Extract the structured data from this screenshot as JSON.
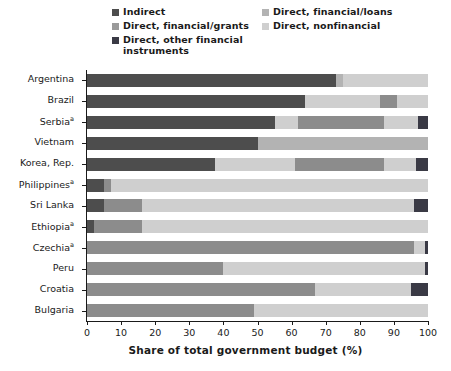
{
  "chart_data": {
    "type": "bar",
    "orientation": "horizontal",
    "stacked": true,
    "stack_mode": "percent",
    "title": "",
    "xlabel": "Share of total government budget (%)",
    "ylabel": "",
    "xlim": [
      0,
      100
    ],
    "xticks": [
      0,
      10,
      20,
      30,
      40,
      50,
      60,
      70,
      80,
      90,
      100
    ],
    "grid": false,
    "legend_position": "top",
    "categories": [
      "Argentina",
      "Brazil",
      "Serbiaᵃ",
      "Vietnam",
      "Korea, Rep.",
      "Philippinesᵃ",
      "Sri Lanka",
      "Ethiopiaᵃ",
      "Czechiaᵃ",
      "Peru",
      "Croatia",
      "Bulgaria"
    ],
    "series": [
      {
        "name": "Indirect",
        "color": "#4d4d4d",
        "values": [
          73,
          64,
          55,
          50,
          37.5,
          5,
          5,
          2,
          0,
          0,
          0,
          0
        ]
      },
      {
        "name": "Direct, financial/loans",
        "color": "#b3b3b3",
        "values": [
          2,
          22,
          7,
          50,
          23,
          2,
          0,
          0,
          0,
          0,
          0,
          0
        ]
      },
      {
        "name": "Direct, financial/grants",
        "color": "#8c8c8c",
        "values": [
          0,
          5,
          25,
          0,
          26,
          0,
          11,
          14,
          96,
          40,
          67,
          49
        ]
      },
      {
        "name": "Direct, nonfinancial",
        "color": "#cfcfcf",
        "values": [
          25,
          9,
          10,
          0,
          10,
          93,
          80,
          84,
          3,
          59,
          28,
          51
        ]
      },
      {
        "name": "Direct, other financial instruments",
        "color": "#3a3a45",
        "values": [
          0,
          0,
          3,
          0,
          3.5,
          0,
          4,
          0,
          1,
          1,
          5,
          0
        ]
      }
    ],
    "bars": [
      {
        "country": "Argentina",
        "segments": [
          {
            "series": "Indirect",
            "start": 0,
            "end": 73
          },
          {
            "series": "Direct, financial/loans",
            "start": 73,
            "end": 75
          },
          {
            "series": "Direct, nonfinancial",
            "start": 75,
            "end": 100
          }
        ]
      },
      {
        "country": "Brazil",
        "segments": [
          {
            "series": "Indirect",
            "start": 0,
            "end": 64
          },
          {
            "series": "Direct, nonfinancial",
            "start": 64,
            "end": 86
          },
          {
            "series": "Direct, financial/grants",
            "start": 86,
            "end": 91
          },
          {
            "series": "Direct, nonfinancial",
            "start": 91,
            "end": 100
          }
        ]
      },
      {
        "country": "Serbiaᵃ",
        "segments": [
          {
            "series": "Indirect",
            "start": 0,
            "end": 55
          },
          {
            "series": "Direct, nonfinancial",
            "start": 55,
            "end": 62
          },
          {
            "series": "Direct, financial/grants",
            "start": 62,
            "end": 87
          },
          {
            "series": "Direct, nonfinancial",
            "start": 87,
            "end": 97
          },
          {
            "series": "Direct, other financial instruments",
            "start": 97,
            "end": 100
          }
        ]
      },
      {
        "country": "Vietnam",
        "segments": [
          {
            "series": "Indirect",
            "start": 0,
            "end": 50
          },
          {
            "series": "Direct, financial/loans",
            "start": 50,
            "end": 100
          }
        ]
      },
      {
        "country": "Korea, Rep.",
        "segments": [
          {
            "series": "Indirect",
            "start": 0,
            "end": 37.5
          },
          {
            "series": "Direct, nonfinancial",
            "start": 37.5,
            "end": 61
          },
          {
            "series": "Direct, financial/grants",
            "start": 61,
            "end": 87
          },
          {
            "series": "Direct, nonfinancial",
            "start": 87,
            "end": 96.5
          },
          {
            "series": "Direct, other financial instruments",
            "start": 96.5,
            "end": 100
          }
        ]
      },
      {
        "country": "Philippinesᵃ",
        "segments": [
          {
            "series": "Indirect",
            "start": 0,
            "end": 5
          },
          {
            "series": "Direct, financial/grants",
            "start": 5,
            "end": 7
          },
          {
            "series": "Direct, nonfinancial",
            "start": 7,
            "end": 100
          }
        ]
      },
      {
        "country": "Sri Lanka",
        "segments": [
          {
            "series": "Indirect",
            "start": 0,
            "end": 5
          },
          {
            "series": "Direct, financial/grants",
            "start": 5,
            "end": 16
          },
          {
            "series": "Direct, nonfinancial",
            "start": 16,
            "end": 96
          },
          {
            "series": "Direct, other financial instruments",
            "start": 96,
            "end": 100
          }
        ]
      },
      {
        "country": "Ethiopiaᵃ",
        "segments": [
          {
            "series": "Indirect",
            "start": 0,
            "end": 2
          },
          {
            "series": "Direct, financial/grants",
            "start": 2,
            "end": 16
          },
          {
            "series": "Direct, nonfinancial",
            "start": 16,
            "end": 100
          }
        ]
      },
      {
        "country": "Czechiaᵃ",
        "segments": [
          {
            "series": "Direct, financial/grants",
            "start": 0,
            "end": 96
          },
          {
            "series": "Direct, nonfinancial",
            "start": 96,
            "end": 99
          },
          {
            "series": "Direct, other financial instruments",
            "start": 99,
            "end": 100
          }
        ]
      },
      {
        "country": "Peru",
        "segments": [
          {
            "series": "Direct, financial/grants",
            "start": 0,
            "end": 40
          },
          {
            "series": "Direct, nonfinancial",
            "start": 40,
            "end": 99
          },
          {
            "series": "Direct, other financial instruments",
            "start": 99,
            "end": 100
          }
        ]
      },
      {
        "country": "Croatia",
        "segments": [
          {
            "series": "Direct, financial/grants",
            "start": 0,
            "end": 67
          },
          {
            "series": "Direct, nonfinancial",
            "start": 67,
            "end": 95
          },
          {
            "series": "Direct, other financial instruments",
            "start": 95,
            "end": 100
          }
        ]
      },
      {
        "country": "Bulgaria",
        "segments": [
          {
            "series": "Direct, financial/grants",
            "start": 0,
            "end": 49
          },
          {
            "series": "Direct, nonfinancial",
            "start": 49,
            "end": 100
          }
        ]
      }
    ]
  },
  "legend": {
    "items": [
      {
        "label": "Indirect",
        "color": "#4d4d4d"
      },
      {
        "label": "Direct, financial/loans",
        "color": "#b3b3b3"
      },
      {
        "label": "Direct, financial/grants",
        "color": "#9a9a9a"
      },
      {
        "label": "Direct, nonfinancial",
        "color": "#cfcfcf"
      },
      {
        "label": "Direct, other financial instruments",
        "color": "#3a3a45"
      }
    ]
  }
}
